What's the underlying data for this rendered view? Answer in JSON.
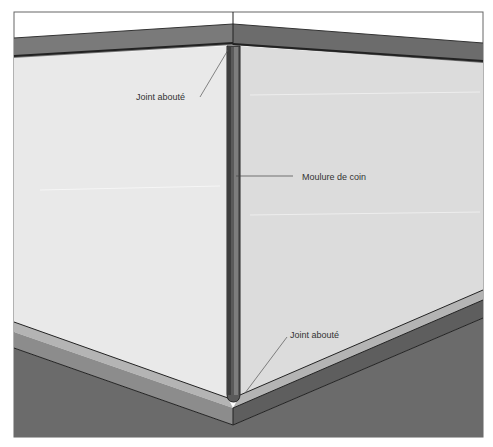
{
  "diagram": {
    "type": "interior wall corner illustration",
    "labels": {
      "top_joint": "Joint abouté",
      "corner_molding": "Moulure de coin",
      "bottom_joint": "Joint abouté"
    },
    "colors": {
      "wall_left": "#e9e9e9",
      "wall_right": "#dcdcdc",
      "crown_molding": "#7a7a7a",
      "corner_post": "#5a5a5a",
      "baseboard_top": "#b4b4b4",
      "baseboard_face": "#8c8c8c",
      "floor": "#6b6b6b",
      "frame": "#555555"
    }
  }
}
